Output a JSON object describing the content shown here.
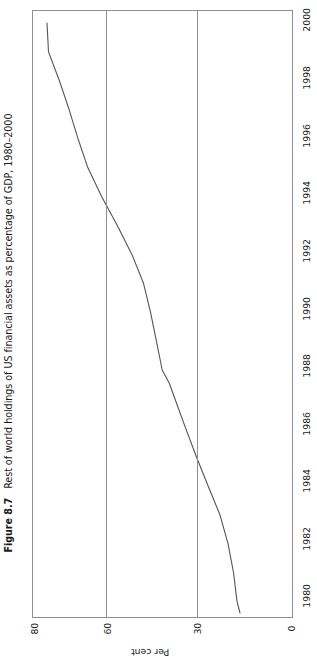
{
  "figure": {
    "number": "Figure 8.7",
    "caption": "Rest of world holdings of US financial assets as percentage of GDP, 1980–2000"
  },
  "chart_data": {
    "type": "line",
    "title": "Rest of world holdings of US financial assets as percentage of GDP, 1980–2000",
    "orientation": "rotated-90-ccw",
    "xlabel": "",
    "ylabel": "Per cent",
    "x": [
      1980,
      1981,
      1982,
      1983,
      1984,
      1985,
      1986,
      1987,
      1988,
      1989,
      1990,
      1991,
      1992,
      1993,
      1994,
      1995,
      1996,
      1997,
      1998,
      1999,
      2000
    ],
    "values": [
      14.5,
      15.5,
      17.0,
      19.5,
      21.5,
      24.0,
      26.5,
      29.0,
      31.0,
      31.5,
      33.5,
      35.0,
      36.5,
      38.5,
      41.0,
      45.5,
      51.0,
      57.5,
      63.0,
      69.5,
      73.0
    ],
    "series": [
      {
        "name": "Rest of world holdings of US financial assets (% of GDP)",
        "values": [
          14.5,
          15.5,
          17.0,
          19.5,
          21.5,
          24.0,
          26.5,
          29.0,
          31.0,
          31.5,
          33.5,
          35.0,
          36.5,
          38.5,
          41.0,
          45.5,
          51.0,
          57.5,
          63.0,
          69.5,
          73.0
        ]
      }
    ],
    "value_axis": {
      "label": "Per cent",
      "ticks": [
        80,
        60,
        30,
        0
      ],
      "tick_labels": [
        "80",
        "60",
        "30",
        "0"
      ],
      "range": [
        0,
        80
      ],
      "gridlines": true,
      "position": "bottom-rotated"
    },
    "time_axis": {
      "ticks": [
        2000,
        1998,
        1996,
        1994,
        1992,
        1990,
        1988,
        1986,
        1984,
        1982,
        1980
      ],
      "tick_labels": [
        "2000",
        "1998",
        "1996",
        "1994",
        "1992",
        "1990",
        "1988",
        "1986",
        "1984",
        "1982",
        "1980"
      ],
      "range": [
        1980,
        2000
      ],
      "gridlines": false,
      "position": "right-rotated"
    },
    "legend": null,
    "grid": true,
    "colors": {
      "line": "#555555",
      "frame": "#8e8e8e",
      "grid": "#8e8e8e",
      "text": "#1a1a1a",
      "background": "#ffffff"
    }
  },
  "value_ticks": [
    {
      "label": "80",
      "left": 34
    },
    {
      "label": "60",
      "left": 107
    },
    {
      "label": "30",
      "left": 197
    },
    {
      "label": "0",
      "left": 291
    }
  ],
  "time_ticks": [
    {
      "label": "2000",
      "top": 22
    },
    {
      "label": "1998",
      "top": 80
    },
    {
      "label": "1996",
      "top": 138
    },
    {
      "label": "1994",
      "top": 195
    },
    {
      "label": "1992",
      "top": 253
    },
    {
      "label": "1990",
      "top": 311
    },
    {
      "label": "1988",
      "top": 368
    },
    {
      "label": "1986",
      "top": 426
    },
    {
      "label": "1984",
      "top": 483
    },
    {
      "label": "1982",
      "top": 541
    },
    {
      "label": "1980",
      "top": 598
    }
  ],
  "gridlines": [
    {
      "name": "gridline-60",
      "left": 73
    },
    {
      "name": "gridline-30",
      "left": 164
    }
  ],
  "series_path": "M 14.0,12 L 15.5,40.9 L 26.4,69.8 L 36.2,98.8 L 45.0,127.7 L 54.8,156.6 L 68.6,185.5 L 84.3,214.4 L 98.9,243.4 L 110.5,272.3 L 117.5,301.2 L 123.4,330.1 L 129.2,359.0 L 136.2,372.0 L 142.0,388.0 L 152.5,416.9 L 163.4,445.8 L 175.0,474.7 L 186.9,503.7 L 195.0,532.6 L 200.5,561.5 L 204.0,590.4 L 207.0,602.0"
}
